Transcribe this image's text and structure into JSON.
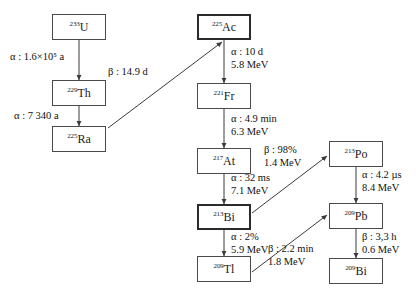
{
  "diagram": {
    "colors": {
      "box_border": "#4a4a4a",
      "box_border_emphasis": "#2b2b2b",
      "arrow": "#3a3a3a",
      "text": "#111111",
      "background": "#ffffff"
    },
    "nodes": [
      {
        "id": "u233",
        "mass": "233",
        "symbol": "U",
        "emphasis": false,
        "x": 52,
        "y": 14,
        "w": 54,
        "h": 26
      },
      {
        "id": "th229",
        "mass": "229",
        "symbol": "Th",
        "emphasis": false,
        "x": 52,
        "y": 80,
        "w": 54,
        "h": 26
      },
      {
        "id": "ra225",
        "mass": "225",
        "symbol": "Ra",
        "emphasis": false,
        "x": 52,
        "y": 126,
        "w": 54,
        "h": 26
      },
      {
        "id": "ac225",
        "mass": "225",
        "symbol": "Ac",
        "emphasis": true,
        "x": 197,
        "y": 14,
        "w": 54,
        "h": 26
      },
      {
        "id": "fr221",
        "mass": "221",
        "symbol": "Fr",
        "emphasis": false,
        "x": 197,
        "y": 83,
        "w": 54,
        "h": 26
      },
      {
        "id": "at217",
        "mass": "217",
        "symbol": "At",
        "emphasis": false,
        "x": 197,
        "y": 148,
        "w": 54,
        "h": 26
      },
      {
        "id": "bi213",
        "mass": "213",
        "symbol": "Bi",
        "emphasis": true,
        "x": 197,
        "y": 204,
        "w": 54,
        "h": 26
      },
      {
        "id": "tl209",
        "mass": "209",
        "symbol": "Tl",
        "emphasis": false,
        "x": 197,
        "y": 256,
        "w": 54,
        "h": 26
      },
      {
        "id": "po213",
        "mass": "213",
        "symbol": "Po",
        "emphasis": false,
        "x": 329,
        "y": 141,
        "w": 54,
        "h": 26
      },
      {
        "id": "pb209",
        "mass": "209",
        "symbol": "Pb",
        "emphasis": false,
        "x": 329,
        "y": 203,
        "w": 54,
        "h": 26
      },
      {
        "id": "bi209",
        "mass": "209",
        "symbol": "Bi",
        "emphasis": false,
        "x": 329,
        "y": 258,
        "w": 54,
        "h": 26
      }
    ],
    "edges": [
      {
        "id": "u233-th229",
        "from": "u233",
        "to": "th229",
        "x1": 79,
        "y1": 40,
        "x2": 79,
        "y2": 80
      },
      {
        "id": "th229-ra225",
        "from": "th229",
        "to": "ra225",
        "x1": 79,
        "y1": 106,
        "x2": 79,
        "y2": 126
      },
      {
        "id": "ra225-ac225",
        "from": "ra225",
        "to": "ac225",
        "x1": 108,
        "y1": 128,
        "x2": 222,
        "y2": 42
      },
      {
        "id": "ac225-fr221",
        "from": "ac225",
        "to": "fr221",
        "x1": 224,
        "y1": 40,
        "x2": 224,
        "y2": 83
      },
      {
        "id": "fr221-at217",
        "from": "fr221",
        "to": "at217",
        "x1": 224,
        "y1": 109,
        "x2": 224,
        "y2": 148
      },
      {
        "id": "at217-bi213",
        "from": "at217",
        "to": "bi213",
        "x1": 224,
        "y1": 174,
        "x2": 224,
        "y2": 204
      },
      {
        "id": "bi213-po213",
        "from": "bi213",
        "to": "po213",
        "x1": 252,
        "y1": 213,
        "x2": 327,
        "y2": 156
      },
      {
        "id": "bi213-tl209",
        "from": "bi213",
        "to": "tl209",
        "x1": 224,
        "y1": 230,
        "x2": 224,
        "y2": 256
      },
      {
        "id": "po213-pb209",
        "from": "po213",
        "to": "pb209",
        "x1": 356,
        "y1": 167,
        "x2": 356,
        "y2": 203
      },
      {
        "id": "tl209-pb209",
        "from": "tl209",
        "to": "pb209",
        "x1": 252,
        "y1": 272,
        "x2": 327,
        "y2": 215
      },
      {
        "id": "pb209-bi209",
        "from": "pb209",
        "to": "bi209",
        "x1": 356,
        "y1": 229,
        "x2": 356,
        "y2": 258
      }
    ],
    "edge_labels": [
      {
        "id": "lbl-u233-th229",
        "line1": "α : 1.6×10⁵ a",
        "line2": "",
        "x": 10,
        "y": 51
      },
      {
        "id": "lbl-th229-ra225",
        "line1": "α : 7 340 a",
        "line2": "",
        "x": 14,
        "y": 110
      },
      {
        "id": "lbl-ra225-ac225",
        "line1": "β : 14.9 d",
        "line2": "",
        "x": 108,
        "y": 66
      },
      {
        "id": "lbl-ac225-fr221",
        "line1": "α : 10 d",
        "line2": "5.8 MeV",
        "x": 231,
        "y": 46
      },
      {
        "id": "lbl-fr221-at217",
        "line1": "α : 4.9 min",
        "line2": "6.3 MeV",
        "x": 231,
        "y": 113
      },
      {
        "id": "lbl-at217-bi213",
        "line1": "α : 32 ms",
        "line2": "7.1 MeV",
        "x": 231,
        "y": 172
      },
      {
        "id": "lbl-bi213-po213",
        "line1": "β : 98%",
        "line2": "1.4 MeV",
        "x": 264,
        "y": 144
      },
      {
        "id": "lbl-bi213-tl209",
        "line1": "α : 2%",
        "line2": "5.9 MeV",
        "x": 231,
        "y": 231
      },
      {
        "id": "lbl-po213-pb209",
        "line1": "α : 4.2 µs",
        "line2": "8.4 MeV",
        "x": 362,
        "y": 169
      },
      {
        "id": "lbl-tl209-pb209",
        "line1": "β : 2.2 min",
        "line2": "1.8 MeV",
        "x": 268,
        "y": 243
      },
      {
        "id": "lbl-pb209-bi209",
        "line1": "β : 3,3 h",
        "line2": "0.6 MeV",
        "x": 362,
        "y": 231
      }
    ]
  }
}
